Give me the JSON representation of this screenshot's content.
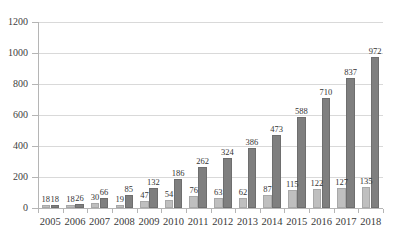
{
  "chart_data": {
    "type": "bar",
    "title": "",
    "subtitle": "",
    "xlabel": "",
    "ylabel": "",
    "ylim": [
      0,
      1200
    ],
    "ytick_step": 200,
    "yticks": [
      "0",
      "200",
      "400",
      "600",
      "800",
      "1000",
      "1200"
    ],
    "grid": true,
    "legend": "none",
    "categories": [
      "2005",
      "2006",
      "2007",
      "2008",
      "2009",
      "2010",
      "2011",
      "2012",
      "2013",
      "2014",
      "2015",
      "2016",
      "2017",
      "2018"
    ],
    "series": [
      {
        "name": "series-1",
        "color": "#bfbfbf",
        "values": [
          18,
          18,
          30,
          19,
          47,
          54,
          76,
          63,
          62,
          87,
          115,
          122,
          127,
          135
        ]
      },
      {
        "name": "series-2",
        "color": "#7f7f7f",
        "values": [
          18,
          26,
          66,
          85,
          132,
          186,
          262,
          324,
          386,
          473,
          588,
          710,
          837,
          972
        ]
      }
    ]
  },
  "axis_colors": {
    "gridline": "#d9d9d9",
    "axis": "#b5b5b5",
    "text": "#3a3a3a"
  }
}
